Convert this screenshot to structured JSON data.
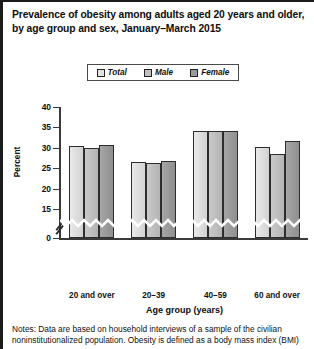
{
  "title": {
    "line1": "Prevalence of obesity among adults aged 20 years and older,",
    "line2": "by age group and sex, January–March 2015"
  },
  "legend": {
    "items": [
      {
        "label": "Total",
        "color": "#e4e4e4"
      },
      {
        "label": "Male",
        "color": "#c0c0c0"
      },
      {
        "label": "Female",
        "color": "#9a9a9a"
      }
    ]
  },
  "axes": {
    "ylabel": "Percent",
    "xlabel": "Age group (years)",
    "yticks": [
      "40",
      "35",
      "30",
      "25",
      "20",
      "15",
      "0"
    ],
    "break_symbol": "axis-break"
  },
  "notes": {
    "line1": "Notes: Data are based on household interviews of a sample of the civilian",
    "line2": "noninstitutionalized population. Obesity is defined as a body mass index (BMI)"
  },
  "chart_data": {
    "type": "bar",
    "title": "Prevalence of obesity among adults aged 20 years and older, by age group and sex, January–March 2015",
    "xlabel": "Age group (years)",
    "ylabel": "Percent",
    "categories": [
      "20 and over",
      "20–39",
      "40–59",
      "60 and over"
    ],
    "series": [
      {
        "name": "Total",
        "values": [
          30.4,
          26.5,
          34.0,
          30.1
        ]
      },
      {
        "name": "Male",
        "values": [
          30.0,
          26.3,
          34.0,
          28.6
        ]
      },
      {
        "name": "Female",
        "values": [
          30.7,
          26.7,
          34.0,
          31.6
        ]
      }
    ],
    "ylim": [
      15,
      40
    ],
    "ytick_values": [
      40,
      35,
      30,
      25,
      20,
      15,
      0
    ],
    "axis_break": true,
    "grid": false,
    "legend_position": "top-center"
  }
}
